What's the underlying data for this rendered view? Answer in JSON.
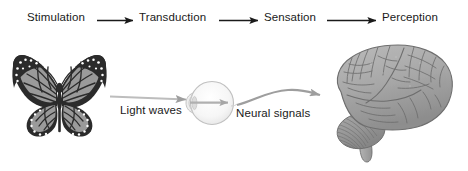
{
  "figure": {
    "width": 468,
    "height": 171,
    "background_color": "#ffffff"
  },
  "process_flow": {
    "stages": [
      {
        "id": "stimulation",
        "label": "Stimulation"
      },
      {
        "id": "transduction",
        "label": "Transduction"
      },
      {
        "id": "sensation",
        "label": "Sensation"
      },
      {
        "id": "perception",
        "label": "Perception"
      }
    ],
    "connector_icon": "right-arrow-icon",
    "connector_color": "#1a1a1a"
  },
  "illustration": {
    "items": [
      {
        "id": "butterfly",
        "icon": "butterfly-icon",
        "alt": "Monarch butterfly stimulus"
      },
      {
        "id": "eye",
        "icon": "eye-icon",
        "alt": "Human eye cross section"
      },
      {
        "id": "brain",
        "icon": "brain-icon",
        "alt": "Human brain lateral view"
      }
    ],
    "flow_labels": [
      {
        "id": "light-waves",
        "label": "Light waves",
        "arrow": "straight-arrow-icon"
      },
      {
        "id": "neural-signals",
        "label": "Neural signals",
        "arrow": "curved-arrow-icon"
      }
    ],
    "arrow_color": "#9e9e9e"
  },
  "colors": {
    "text": "#1a1a1a",
    "top_arrow": "#1a1a1a",
    "flow_arrow": "#9e9e9e",
    "butterfly_dark": "#2b2b2b",
    "butterfly_mid": "#9a9a9a",
    "eye_fill": "#f2f2f2",
    "eye_stroke": "#b5b5b5",
    "brain_fill": "#a8a8a8",
    "brain_stroke": "#6e6e6e"
  }
}
